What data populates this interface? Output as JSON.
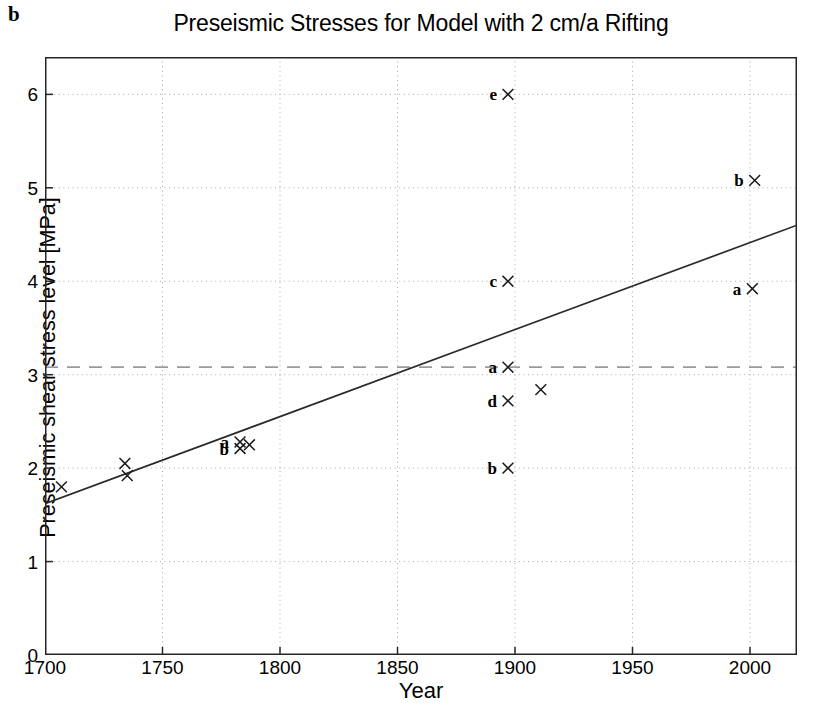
{
  "panel": {
    "letter": "b"
  },
  "chart_data": {
    "type": "scatter",
    "title": "Preseismic Stresses for Model with 2 cm/a Rifting",
    "xlabel": "Year",
    "ylabel": "Preseismic shear stress level [MPa]",
    "xlim": [
      1700,
      2020
    ],
    "ylim": [
      0,
      6.4
    ],
    "grid": true,
    "legend": "none",
    "xticks": [
      1700,
      1750,
      1800,
      1850,
      1900,
      1950,
      2000
    ],
    "xtick_labels": [
      "1700",
      "1750",
      "1800",
      "1850",
      "1900",
      "1950",
      "2000"
    ],
    "yticks": [
      0,
      1,
      2,
      3,
      4,
      5,
      6
    ],
    "ytick_labels": [
      "0",
      "1",
      "2",
      "3",
      "4",
      "5",
      "6"
    ],
    "marker": "x",
    "points": [
      {
        "x": 1707,
        "y": 1.8,
        "label": ""
      },
      {
        "x": 1734,
        "y": 2.05,
        "label": ""
      },
      {
        "x": 1735,
        "y": 1.92,
        "label": ""
      },
      {
        "x": 1783,
        "y": 2.28,
        "label": "a"
      },
      {
        "x": 1783,
        "y": 2.21,
        "label": "b"
      },
      {
        "x": 1787,
        "y": 2.25,
        "label": ""
      },
      {
        "x": 1897,
        "y": 6.0,
        "label": "e"
      },
      {
        "x": 1897,
        "y": 4.0,
        "label": "c"
      },
      {
        "x": 1897,
        "y": 3.08,
        "label": "a"
      },
      {
        "x": 1897,
        "y": 2.72,
        "label": "d"
      },
      {
        "x": 1897,
        "y": 2.0,
        "label": "b"
      },
      {
        "x": 1911,
        "y": 2.84,
        "label": ""
      },
      {
        "x": 2002,
        "y": 5.08,
        "label": "b"
      },
      {
        "x": 2001,
        "y": 3.92,
        "label": "a"
      }
    ],
    "trend_line": {
      "style": "solid",
      "x": [
        1700,
        2020
      ],
      "y": [
        1.62,
        4.6
      ]
    },
    "threshold_line": {
      "style": "dashed",
      "y": 3.08,
      "x": [
        1700,
        2020
      ]
    }
  },
  "colors": {
    "axis": "#262626",
    "grid": "#a8a8a8",
    "data": "#1a1a1a",
    "trend": "#2b2b2b",
    "threshold": "#9a9a9a"
  }
}
